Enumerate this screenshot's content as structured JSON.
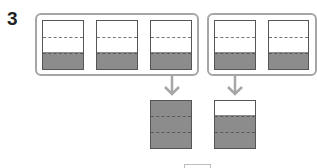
{
  "problem": {
    "number": "3"
  },
  "colors": {
    "frame": "#a6a6a6",
    "box_border": "#555555",
    "shade": "#8c8c8c",
    "arrow": "#a6a6a6"
  },
  "diagram": {
    "groups": [
      {
        "name": "group-left",
        "bar_count": 3,
        "shaded_thirds_each": 1,
        "result_shaded_thirds": 3
      },
      {
        "name": "group-right",
        "bar_count": 2,
        "shaded_thirds_each": 1,
        "result_shaded_thirds": 2
      }
    ],
    "parts_per_bar": 3
  }
}
